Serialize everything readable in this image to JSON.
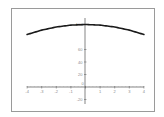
{
  "chart_data": {
    "type": "line",
    "title": "",
    "xlabel": "",
    "ylabel": "",
    "xlim": [
      -4,
      4
    ],
    "ylim": [
      -20,
      100
    ],
    "grid": false,
    "legend": null,
    "x_ticks": [
      "-4",
      "-3",
      "-2",
      "-1",
      "0",
      "1",
      "2",
      "3",
      "4"
    ],
    "y_ticks": [
      "100",
      "60",
      "40",
      "20",
      "-20"
    ],
    "series": [
      {
        "name": "curve",
        "x": [
          -4,
          -3,
          -2,
          -1,
          0,
          1,
          2,
          3,
          4
        ],
        "values": [
          84,
          91,
          96,
          99,
          100,
          99,
          96,
          91,
          84
        ]
      }
    ],
    "line_color": "#1a1a1a"
  }
}
